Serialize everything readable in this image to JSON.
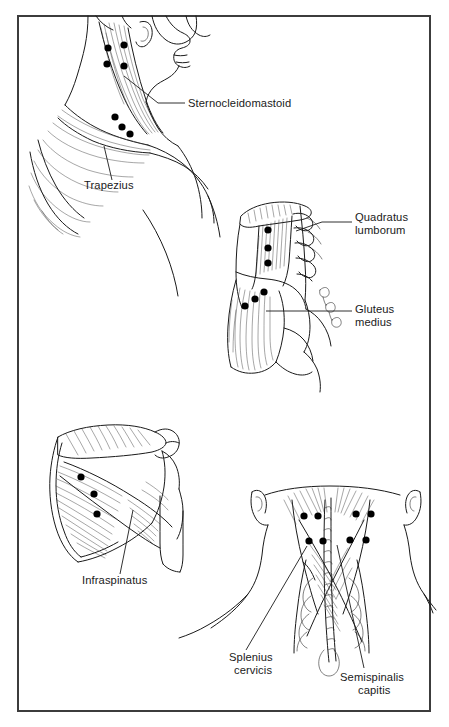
{
  "plate": {
    "title": "Trigger point reference plate",
    "background_color": "#ffffff",
    "ink_color": "#1a1a1a",
    "trigger_point_color": "#000000",
    "frame": {
      "x": 17,
      "y": 15,
      "width": 414,
      "height": 697,
      "border_color": "#3c3c3c"
    }
  },
  "panels": [
    {
      "id": "panel-neck-lateral",
      "name": "Lateral head neck and shoulder view",
      "labels": [
        {
          "id": "sternocleidomastoid",
          "text": "Sternocleidomastoid",
          "x": 188,
          "y": 107,
          "anchor": "start",
          "leader": "M 185,103 L 158,103 L 124,76"
        },
        {
          "id": "trapezius",
          "text": "Trapezius",
          "x": 84,
          "y": 189,
          "anchor": "start",
          "leader": "M 112,180 L 104,146"
        }
      ],
      "trigger_points": [
        {
          "cx": 108,
          "cy": 48,
          "r": 3.6
        },
        {
          "cx": 124,
          "cy": 45,
          "r": 3.6
        },
        {
          "cx": 107,
          "cy": 64,
          "r": 3.6
        },
        {
          "cx": 124,
          "cy": 66,
          "r": 3.6
        },
        {
          "cx": 115,
          "cy": 117,
          "r": 3.6
        },
        {
          "cx": 122,
          "cy": 127,
          "r": 3.6
        },
        {
          "cx": 130,
          "cy": 134,
          "r": 3.6
        }
      ]
    },
    {
      "id": "panel-lumbar-hip",
      "name": "Lumbar spine and hip lateral view",
      "labels": [
        {
          "id": "quadratus-lumborum",
          "text": "Quadratus",
          "text_line2": "lumborum",
          "x": 355,
          "y": 221,
          "anchor": "start",
          "leader": "M 352,222 L 322,222 L 296,231"
        },
        {
          "id": "gluteus-medius",
          "text": "Gluteus",
          "text_line2": "medius",
          "x": 355,
          "y": 313,
          "anchor": "start",
          "leader": "M 352,311 L 266,311"
        }
      ],
      "trigger_points": [
        {
          "cx": 268,
          "cy": 230,
          "r": 3.6
        },
        {
          "cx": 268,
          "cy": 248,
          "r": 3.6
        },
        {
          "cx": 268,
          "cy": 263,
          "r": 3.6
        },
        {
          "cx": 245,
          "cy": 306,
          "r": 3.6
        },
        {
          "cx": 255,
          "cy": 299,
          "r": 3.6
        },
        {
          "cx": 264,
          "cy": 292,
          "r": 3.6
        }
      ]
    },
    {
      "id": "panel-scapula",
      "name": "Posterior scapula and humerus view",
      "labels": [
        {
          "id": "infraspinatus",
          "text": "Infraspinatus",
          "x": 82,
          "y": 584,
          "anchor": "start",
          "leader": "M 120,574 L 133,510"
        }
      ],
      "trigger_points": [
        {
          "cx": 81,
          "cy": 477,
          "r": 3.6
        },
        {
          "cx": 94,
          "cy": 494,
          "r": 3.6
        },
        {
          "cx": 97,
          "cy": 514,
          "r": 3.6
        }
      ]
    },
    {
      "id": "panel-posterior-neck",
      "name": "Posterior neck view",
      "labels": [
        {
          "id": "splenius-cervicis",
          "text": "Splenius",
          "text_line2": "cervicis",
          "x": 229,
          "y": 661,
          "anchor": "start",
          "leader": "M 246,650 L 307,546"
        },
        {
          "id": "semispinalis-capitis",
          "text": "Semispinalis",
          "text_line2": "capitis",
          "x": 340,
          "y": 681,
          "anchor": "start",
          "leader": "M 364,668 L 337,545"
        }
      ],
      "trigger_points": [
        {
          "cx": 304,
          "cy": 516,
          "r": 3.6
        },
        {
          "cx": 318,
          "cy": 516,
          "r": 3.6
        },
        {
          "cx": 356,
          "cy": 514,
          "r": 3.6
        },
        {
          "cx": 371,
          "cy": 514,
          "r": 3.6
        },
        {
          "cx": 309,
          "cy": 541,
          "r": 3.6
        },
        {
          "cx": 323,
          "cy": 541,
          "r": 3.6
        },
        {
          "cx": 350,
          "cy": 540,
          "r": 3.6
        },
        {
          "cx": 366,
          "cy": 540,
          "r": 3.6
        }
      ]
    }
  ]
}
